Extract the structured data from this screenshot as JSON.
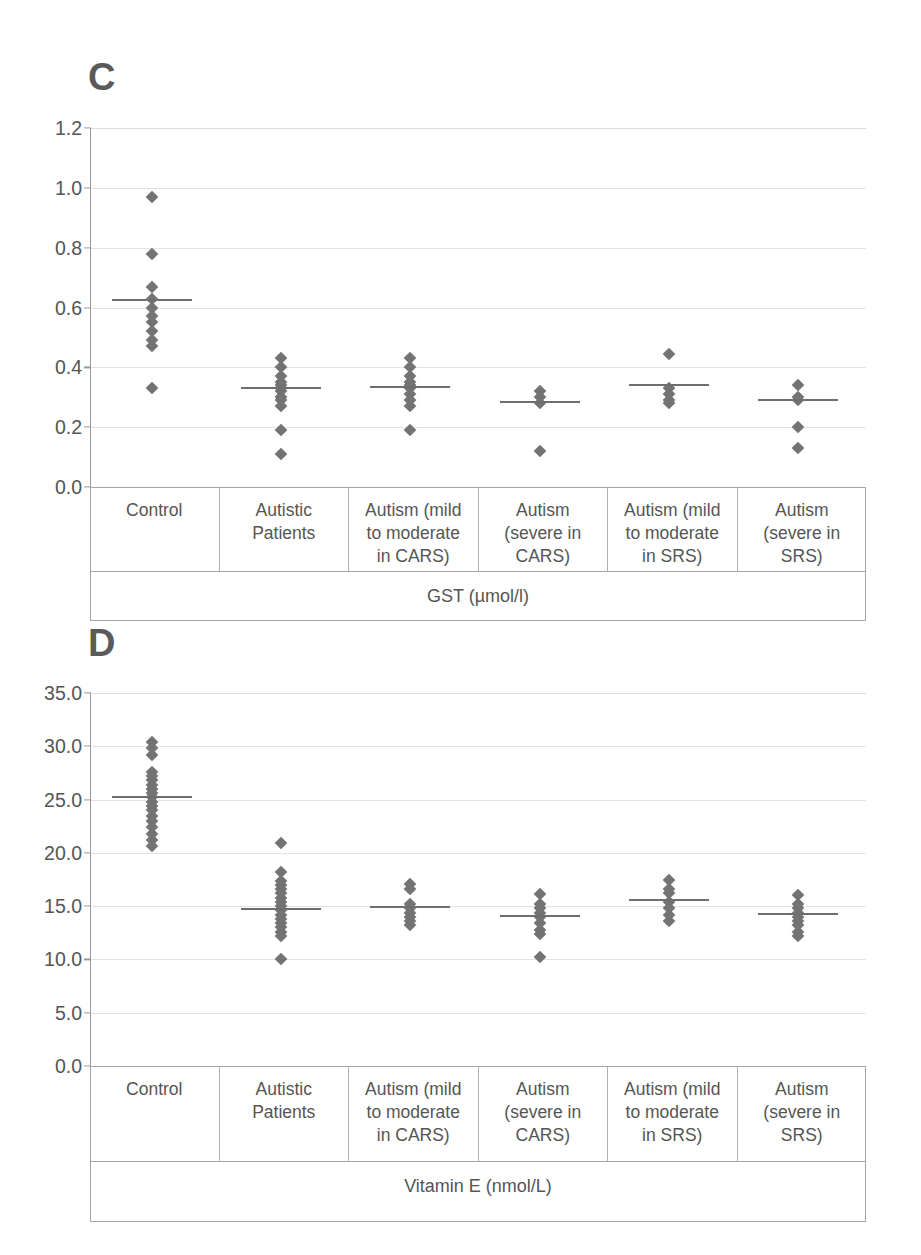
{
  "figure": {
    "panels": [
      {
        "letter": "C",
        "axis_title": "GST (µmol/l)",
        "chart_index": 0
      },
      {
        "letter": "D",
        "axis_title": "Vitamin E (nmol/L)",
        "chart_index": 1
      }
    ],
    "marker_color": "#737373",
    "mean_line_color": "#6e6e6e",
    "grid_color": "#e2e2e2",
    "axis_color": "#9a9a9a",
    "text_color": "#555555"
  },
  "chart_data": [
    {
      "type": "scatter",
      "panel": "C",
      "title": "",
      "xlabel": "GST (µmol/l)",
      "ylabel": "",
      "ylim": [
        0.0,
        1.2
      ],
      "yticks": [
        "0.0",
        "0.2",
        "0.4",
        "0.6",
        "0.8",
        "1.0",
        "1.2"
      ],
      "ytick_values": [
        0.0,
        0.2,
        0.4,
        0.6,
        0.8,
        1.0,
        1.2
      ],
      "grid": true,
      "legend": "none",
      "categories": [
        "Control",
        "Autistic\nPatients",
        "Autism (mild\nto moderate\nin CARS)",
        "Autism\n(severe in\nCARS)",
        "Autism (mild\nto moderate\nin SRS)",
        "Autism\n(severe in\nSRS)"
      ],
      "groups": [
        {
          "name": "Control",
          "mean": 0.625,
          "values": [
            0.97,
            0.78,
            0.67,
            0.63,
            0.6,
            0.57,
            0.55,
            0.52,
            0.49,
            0.47,
            0.33
          ]
        },
        {
          "name": "Autistic Patients",
          "mean": 0.33,
          "values": [
            0.43,
            0.4,
            0.37,
            0.35,
            0.34,
            0.33,
            0.32,
            0.3,
            0.29,
            0.27,
            0.19,
            0.11
          ]
        },
        {
          "name": "Autism (mild to moderate in CARS)",
          "mean": 0.335,
          "values": [
            0.43,
            0.4,
            0.37,
            0.35,
            0.34,
            0.33,
            0.31,
            0.29,
            0.27,
            0.19
          ]
        },
        {
          "name": "Autism (severe in CARS)",
          "mean": 0.285,
          "values": [
            0.32,
            0.3,
            0.28,
            0.12
          ]
        },
        {
          "name": "Autism (mild to moderate in SRS)",
          "mean": 0.34,
          "values": [
            0.445,
            0.33,
            0.31,
            0.29,
            0.28
          ]
        },
        {
          "name": "Autism (severe in SRS)",
          "mean": 0.29,
          "values": [
            0.34,
            0.3,
            0.29,
            0.2,
            0.13
          ]
        }
      ]
    },
    {
      "type": "scatter",
      "panel": "D",
      "title": "",
      "xlabel": "Vitamin E (nmol/L)",
      "ylabel": "",
      "ylim": [
        0.0,
        35.0
      ],
      "yticks": [
        "0.0",
        "5.0",
        "10.0",
        "15.0",
        "20.0",
        "25.0",
        "30.0",
        "35.0"
      ],
      "ytick_values": [
        0.0,
        5.0,
        10.0,
        15.0,
        20.0,
        25.0,
        30.0,
        35.0
      ],
      "grid": true,
      "legend": "none",
      "categories": [
        "Control",
        "Autistic\nPatients",
        "Autism (mild\nto moderate\nin CARS)",
        "Autism\n(severe in\nCARS)",
        "Autism (mild\nto moderate\nin SRS)",
        "Autism\n(severe in\nSRS)"
      ],
      "groups": [
        {
          "name": "Control",
          "mean": 25.2,
          "values": [
            30.4,
            29.8,
            29.2,
            27.6,
            27.2,
            26.8,
            26.4,
            26.0,
            25.6,
            25.2,
            24.8,
            24.4,
            24.0,
            23.5,
            23.0,
            22.4,
            21.8,
            21.2,
            20.6
          ]
        },
        {
          "name": "Autistic Patients",
          "mean": 14.7,
          "values": [
            20.9,
            18.2,
            17.4,
            17.0,
            16.6,
            16.2,
            15.8,
            15.4,
            15.0,
            14.6,
            14.2,
            13.8,
            13.4,
            13.0,
            12.6,
            12.2,
            10.0
          ]
        },
        {
          "name": "Autism (mild to moderate in CARS)",
          "mean": 14.9,
          "values": [
            17.1,
            16.6,
            15.2,
            14.8,
            14.4,
            14.0,
            13.6,
            13.2
          ]
        },
        {
          "name": "Autism (severe in CARS)",
          "mean": 14.1,
          "values": [
            16.1,
            15.2,
            14.8,
            14.4,
            14.0,
            13.4,
            12.8,
            12.4,
            10.2
          ]
        },
        {
          "name": "Autism (mild to moderate in SRS)",
          "mean": 15.6,
          "values": [
            17.5,
            16.6,
            16.2,
            15.4,
            14.8,
            14.2,
            13.6
          ]
        },
        {
          "name": "Autism (severe in SRS)",
          "mean": 14.3,
          "values": [
            16.0,
            15.2,
            14.8,
            14.4,
            14.0,
            13.6,
            13.2,
            12.6,
            12.2
          ]
        }
      ]
    }
  ]
}
